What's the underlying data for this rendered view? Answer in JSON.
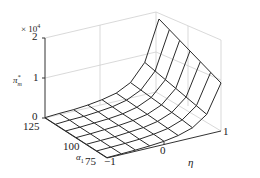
{
  "chart_data": {
    "type": "surface",
    "title": "",
    "xlabel": "η",
    "ylabel": "α₁",
    "zlabel": "π*ₘ",
    "z_multiplier": "× 10⁴",
    "x_ticks": [
      "-1",
      "0",
      "1"
    ],
    "y_ticks": [
      "75",
      "100",
      "125"
    ],
    "z_ticks": [
      "0",
      "1",
      "2"
    ],
    "xlim": [
      -1,
      1
    ],
    "ylim": [
      75,
      125
    ],
    "zlim": [
      0,
      2
    ],
    "grid": true,
    "x": [
      -1,
      -0.75,
      -0.5,
      -0.25,
      0,
      0.25,
      0.5,
      0.75,
      1
    ],
    "y": [
      75,
      83.3,
      91.7,
      100,
      108.3,
      116.7,
      125
    ],
    "z_approx_x1e4": [
      [
        0.01,
        0.02,
        0.03,
        0.05,
        0.08,
        0.14,
        0.25,
        0.5,
        1.2
      ],
      [
        0.01,
        0.02,
        0.03,
        0.05,
        0.09,
        0.15,
        0.28,
        0.55,
        1.3
      ],
      [
        0.01,
        0.02,
        0.03,
        0.06,
        0.09,
        0.16,
        0.3,
        0.6,
        1.4
      ],
      [
        0.01,
        0.02,
        0.04,
        0.06,
        0.1,
        0.17,
        0.32,
        0.65,
        1.5
      ],
      [
        0.01,
        0.02,
        0.04,
        0.06,
        0.1,
        0.18,
        0.34,
        0.7,
        1.6
      ],
      [
        0.01,
        0.03,
        0.04,
        0.07,
        0.11,
        0.19,
        0.36,
        0.75,
        1.7
      ],
      [
        0.01,
        0.03,
        0.04,
        0.07,
        0.12,
        0.2,
        0.38,
        0.8,
        1.8
      ]
    ]
  },
  "labels": {
    "z_multiplier": "× 10",
    "z_multiplier_exp": "4",
    "z_label_main": "π",
    "z_label_sub": "m",
    "z_label_sup": "*",
    "z_tick_0": "0",
    "z_tick_1": "1",
    "z_tick_2": "2",
    "y_label_main": "α",
    "y_label_sub": "1",
    "y_tick_125": "125",
    "y_tick_100": "100",
    "y_tick_75": "75",
    "x_label": "η",
    "x_tick_m1": "−1",
    "x_tick_0": "0",
    "x_tick_1": "1"
  },
  "colors": {
    "surface_line": "#2a2a2a",
    "grid_line": "#cfcfcf",
    "axis_line": "#333333"
  }
}
